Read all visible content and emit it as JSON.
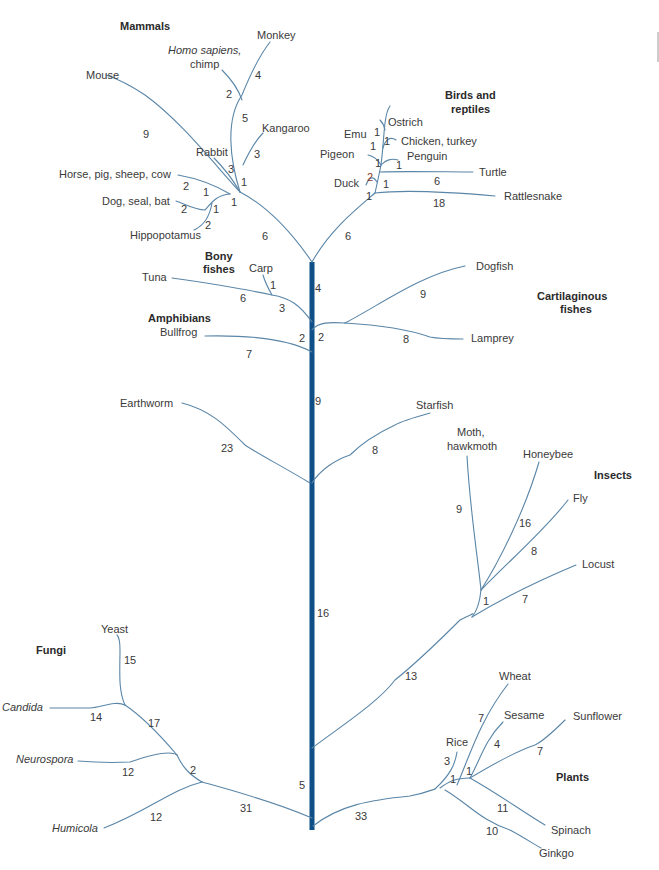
{
  "figure": {
    "type": "phylogenetic-tree",
    "colors": {
      "trunk": "#0d4f86",
      "branch": "#5a86a8",
      "text": "#3a3a3a"
    }
  },
  "groups": {
    "mammals": "Mammals",
    "birds_1": "Birds and",
    "birds_2": "reptiles",
    "bony_1": "Bony",
    "bony_2": "fishes",
    "amphibians": "Amphibians",
    "cart_1": "Cartilaginous",
    "cart_2": "fishes",
    "insects": "Insects",
    "fungi": "Fungi",
    "plants": "Plants"
  },
  "taxa": {
    "monkey": "Monkey",
    "homo_1": "Homo sapiens,",
    "homo_2": "chimp",
    "mouse": "Mouse",
    "kangaroo": "Kangaroo",
    "rabbit": "Rabbit",
    "horse": "Horse, pig, sheep, cow",
    "dog": "Dog, seal, bat",
    "hippo": "Hippopotamus",
    "emu": "Emu",
    "ostrich": "Ostrich",
    "chicken": "Chicken, turkey",
    "pigeon": "Pigeon",
    "penguin": "Penguin",
    "turtle": "Turtle",
    "duck": "Duck",
    "rattlesnake": "Rattlesnake",
    "tuna": "Tuna",
    "carp": "Carp",
    "bullfrog": "Bullfrog",
    "dogfish": "Dogfish",
    "lamprey": "Lamprey",
    "earthworm": "Earthworm",
    "starfish": "Starfish",
    "moth_1": "Moth,",
    "moth_2": "hawkmoth",
    "honeybee": "Honeybee",
    "fly": "Fly",
    "locust": "Locust",
    "yeast": "Yeast",
    "candida": "Candida",
    "neurospora": "Neurospora",
    "humicola": "Humicola",
    "wheat": "Wheat",
    "sesame": "Sesame",
    "sunflower": "Sunflower",
    "rice": "Rice",
    "spinach": "Spinach",
    "ginkgo": "Ginkgo"
  },
  "branch_lengths": {
    "monkey": "4",
    "homo": "2",
    "primate_stem": "5",
    "kangaroo": "3",
    "rabbit": "3",
    "kang_stem": "1",
    "mouse": "9",
    "horse_outer": "2",
    "horse_inner": "1",
    "dog_outer": "2",
    "dog_inner": "1",
    "hippo": "2",
    "mammal_node": "1",
    "mammal_stem": "6",
    "emu": "1",
    "ostrich_a": "1",
    "ostrich_b": "1",
    "chicken": "1",
    "pigeon": "1",
    "penguin": "1",
    "duck": "2",
    "bird_inner": "1",
    "turtle": "6",
    "bird_node": "1",
    "rattlesnake": "18",
    "bird_stem": "6",
    "carp": "1",
    "tuna": "6",
    "fish_stem": "3",
    "trunk_top": "4",
    "bullfrog": "7",
    "amph_stem": "2",
    "cart_stem": "2",
    "dogfish": "9",
    "lamprey": "8",
    "trunk_mid": "9",
    "earthworm": "23",
    "starfish": "8",
    "moth": "9",
    "honeybee": "16",
    "fly": "8",
    "insect_inner": "1",
    "locust": "7",
    "insect_stem": "13",
    "trunk_low": "16",
    "yeast": "15",
    "candida": "14",
    "fungi_inner": "17",
    "neurospora": "12",
    "fungi_node": "2",
    "humicola": "12",
    "fungi_stem": "31",
    "trunk_base": "5",
    "wheat": "7",
    "sesame": "4",
    "sunflower": "7",
    "rice": "3",
    "plant_inner_a": "1",
    "plant_inner_b": "1",
    "spinach": "11",
    "ginkgo": "10",
    "plant_stem": "33"
  }
}
